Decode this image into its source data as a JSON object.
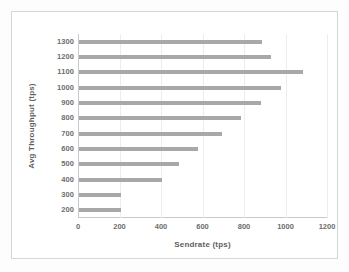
{
  "chart_data": {
    "type": "bar",
    "orientation": "horizontal",
    "title": "",
    "xlabel": "Sendrate (tps)",
    "ylabel": "Avg Throughput (tps)",
    "categories": [
      "200",
      "300",
      "400",
      "500",
      "600",
      "700",
      "800",
      "900",
      "1000",
      "1100",
      "1200",
      "1300"
    ],
    "values": [
      200,
      200,
      400,
      480,
      575,
      690,
      780,
      875,
      975,
      1080,
      925,
      880
    ],
    "xlim": [
      0,
      1200
    ],
    "xticks": [
      0,
      200,
      400,
      600,
      800,
      1000,
      1200
    ],
    "xtick_labels": [
      "0",
      "200",
      "400",
      "600",
      "800",
      "1000",
      "1200"
    ],
    "ytick_labels": [
      "1300",
      "1200",
      "1100",
      "1000",
      "900",
      "800",
      "700",
      "600",
      "500",
      "400",
      "300",
      "200"
    ],
    "grid": true,
    "legend": null,
    "bar_color": "#a8a8a8",
    "text_color": "#6d6d6d",
    "grid_color": "#ededed",
    "axis_color": "#c9c9c9",
    "background": "#ffffff",
    "series_display_order": [
      {
        "category": "1300",
        "value": 880
      },
      {
        "category": "1200",
        "value": 925
      },
      {
        "category": "1100",
        "value": 1080
      },
      {
        "category": "1000",
        "value": 975
      },
      {
        "category": "900",
        "value": 875
      },
      {
        "category": "800",
        "value": 780
      },
      {
        "category": "700",
        "value": 690
      },
      {
        "category": "600",
        "value": 575
      },
      {
        "category": "500",
        "value": 480
      },
      {
        "category": "400",
        "value": 400
      },
      {
        "category": "300",
        "value": 200
      },
      {
        "category": "200",
        "value": 200
      }
    ]
  }
}
